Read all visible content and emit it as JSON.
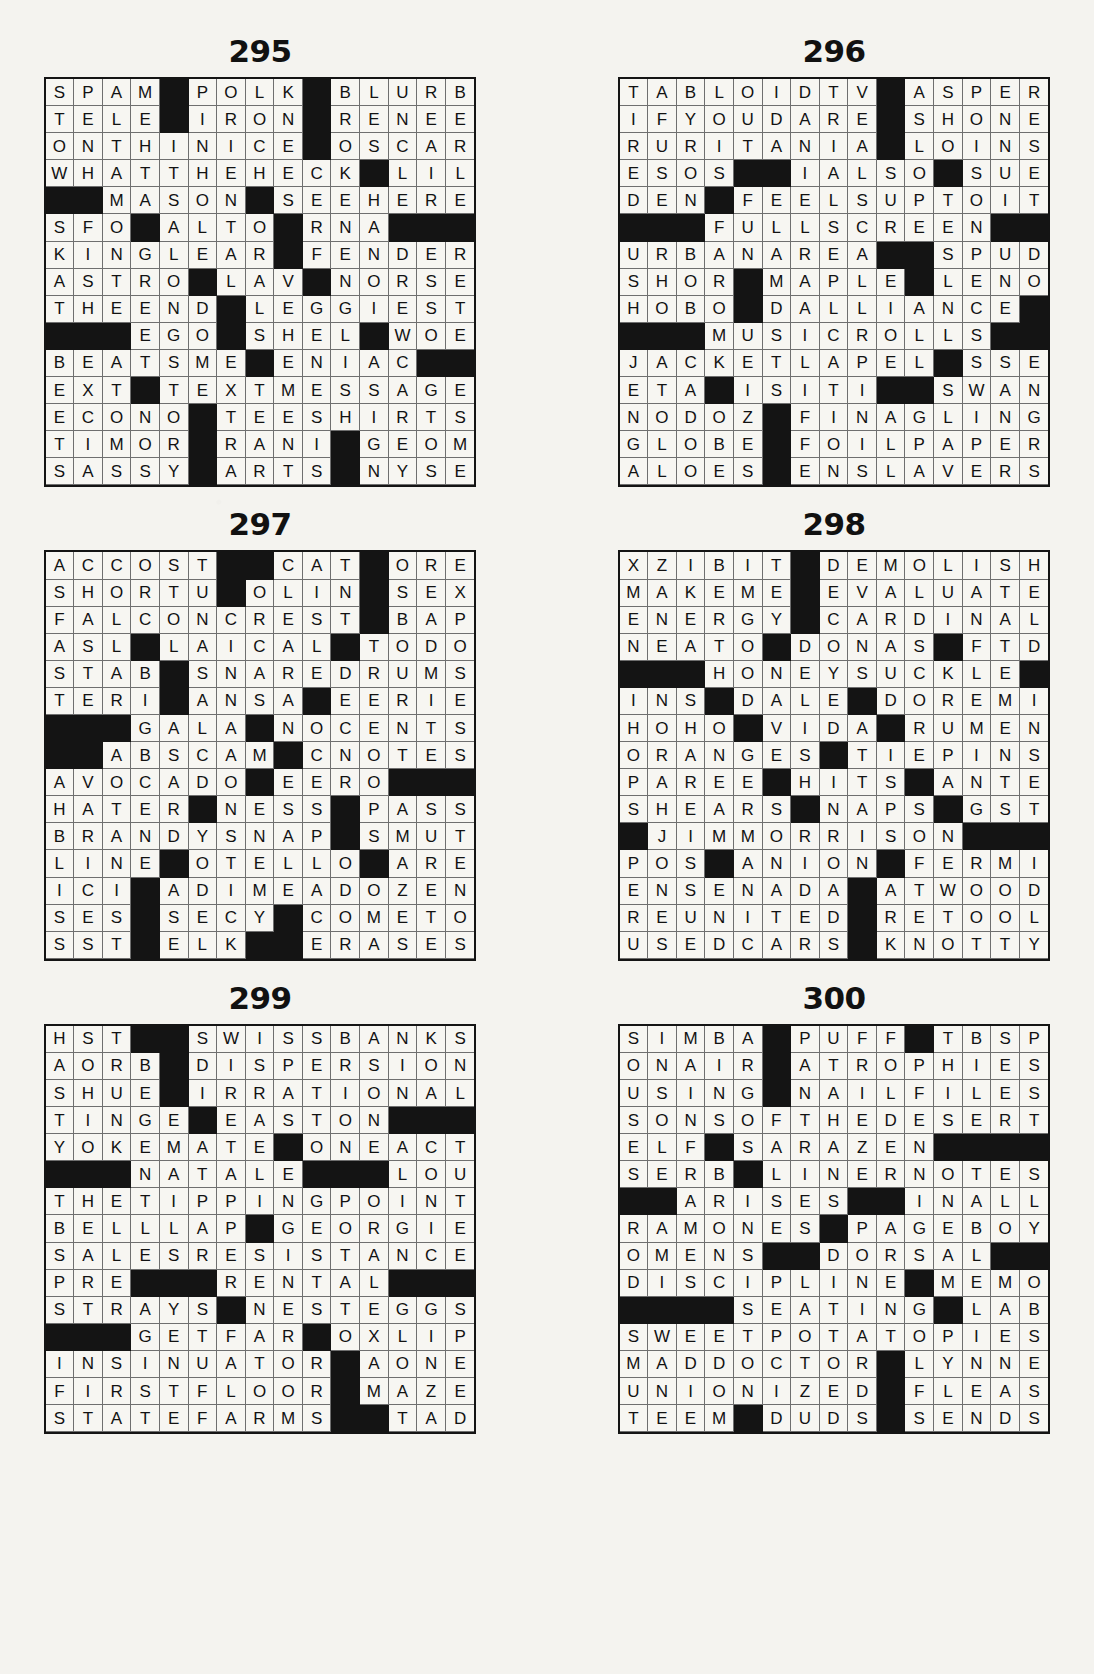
{
  "page": {
    "background_color": "#f4f3ef",
    "block_color": "#141414",
    "cell_color": "#f7f6f2",
    "text_color": "#121212"
  },
  "puzzles": [
    {
      "number": "295",
      "rows": 15,
      "cols": 15,
      "grid": [
        "SPAM#POLK#BLURB",
        "TELE#IRON#RENEE",
        "ONTHINICE#OSCAR",
        "WHATTHEHECK#LIL",
        "##MASON#SEEHERE",
        "SFO#ALTO#RNA###",
        "KINGLEAR#FENDER",
        "ASTRO#LAV#NORSE",
        "THEEND#LEGGIEST",
        "###EGO#SHEL#WOE",
        "BEATSME#ENIAC##",
        "EXT#TEXTMESSAGE",
        "ECONO#TEESHIRTS",
        "TIMOR#RANI#GEOM",
        "SASSY#ARTS#NYSE"
      ]
    },
    {
      "number": "296",
      "rows": 15,
      "cols": 15,
      "grid": [
        "TABLOIDTV#ASPER",
        "IFYOUDARE#SHONE",
        "RURITANIA#LOINS",
        "ESOS##IALSO#SUE",
        "DEN#FEELSUPTOIT",
        "###FULLSCREEN##",
        "URBANAREA##SPUD",
        "SHOR#MAPLE#LENO",
        "HOBO#DALLIANCE#",
        "###MUSICROLLS##",
        "JACKETLAPEL#SSE",
        "ETA#ISITI##SWAN",
        "NODOZ#FINAGLING",
        "GLOBE#FOILPAPER",
        "ALOES#ENSLAVERS"
      ]
    },
    {
      "number": "297",
      "rows": 15,
      "cols": 15,
      "grid": [
        "ACCOST##CAT#ORE",
        "SHORTU#OLIN#SEX",
        "FALCONCREST#BAP",
        "ASL#LAICAL#TODO",
        "STAB#SNAREDRUMS",
        "TERI#ANSA#EERIE",
        "###GALA#NOCENTS",
        "##ABSCAM#CNOTES",
        "AVOCADO#EERO###",
        "HATER#NESS#PASS",
        "BRANDYSNAP#SMUT",
        "LINE#OTELLO#ARE",
        "ICI#ADIMEADOZEN",
        "SES#SECY#COMETO",
        "SST#ELK##ERASES"
      ]
    },
    {
      "number": "298",
      "rows": 15,
      "cols": 15,
      "grid": [
        "XZIBIT#DEMOLISH",
        "MAKEME#EVALUATE",
        "ENERGY#CARDINAL",
        "NEATO#DONAS#FTD",
        "###HONEYSUCKLE#",
        "INS#DALE#DOREMI",
        "HOHO#VIDA#RUMEN",
        "ORANGES#TIEPINS",
        "PAREE#HITS#ANTE",
        "SHEARS#NAPS#GST",
        "#JIMMORRISON###",
        "POS#ANION#FERMI",
        "ENSENADA#ATWOOD",
        "REUNITED#RETOOL",
        "USEDCARS#KNOTTY"
      ]
    },
    {
      "number": "299",
      "rows": 15,
      "cols": 15,
      "grid": [
        "HST##SWISSBANKS",
        "AORB#DISPERSION",
        "SHUE#IRRATIONAL",
        "TINGE#EASTON###",
        "YOKEMATE#ONEACT",
        "###NATALE###LOU",
        "THETIPPINGPOINT",
        "BELLLAP#GEORGIE",
        "SALESRESISTANCE",
        "PRE###RENTAL###",
        "STRAYS#NESTEGGS",
        "###GETFAR#OXLIP",
        "INSINUATOR#AONE",
        "FIRSTFLOOR#MAZE",
        "STATEFARMS##TAD"
      ]
    },
    {
      "number": "300",
      "rows": 15,
      "cols": 15,
      "grid": [
        "SIMBA#PUFF#TBSP",
        "ONAIR#ATROPHIES",
        "USING#NAILFILES",
        "SONSOFTHEDESERT",
        "ELF#SARAZEN####",
        "SERB#LINERNOTES",
        "##ARISES##INALL",
        "RAMONES#PAGEBOY",
        "OMENS##DORSAL##",
        "DISCIPLINE#MEMO",
        "####SEATING#LAB",
        "SWEETPOTATOPIES",
        "MADDOCTOR#LYNNE",
        "UNIONIZED#FLEAS",
        "TEEM#DUDS#SENDS"
      ]
    }
  ]
}
